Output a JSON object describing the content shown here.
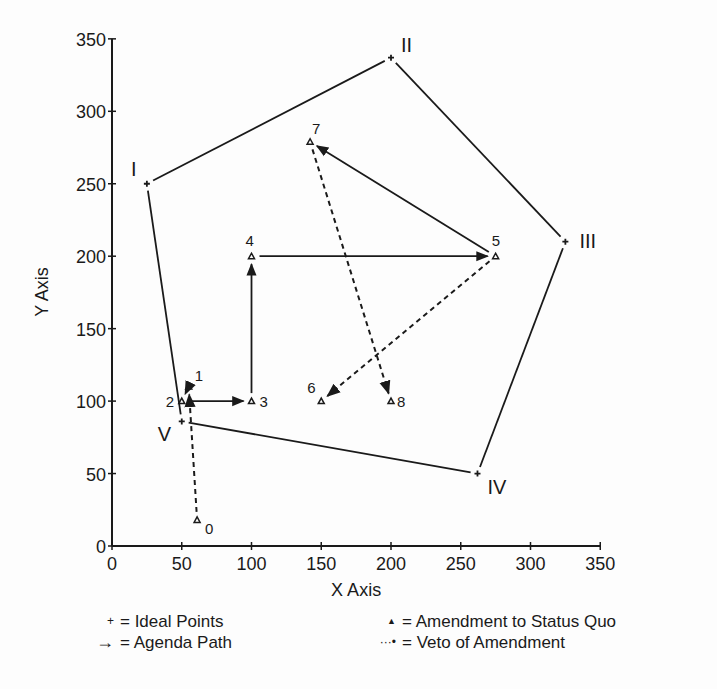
{
  "chart_data": {
    "type": "scatter",
    "title": "",
    "xlabel": "X Axis",
    "ylabel": "Y Axis",
    "xlim": [
      0,
      350
    ],
    "ylim": [
      0,
      350
    ],
    "x_ticks": [
      0,
      50,
      100,
      150,
      200,
      250,
      300,
      350
    ],
    "y_ticks": [
      0,
      50,
      100,
      150,
      200,
      250,
      300,
      350
    ],
    "grid": false,
    "legend_position": "bottom",
    "ideal_points": [
      {
        "label": "I",
        "x": 25,
        "y": 250
      },
      {
        "label": "II",
        "x": 200,
        "y": 337
      },
      {
        "label": "III",
        "x": 325,
        "y": 210
      },
      {
        "label": "IV",
        "x": 262,
        "y": 50
      },
      {
        "label": "V",
        "x": 50,
        "y": 86
      }
    ],
    "ideal_polygon_order": [
      "I",
      "II",
      "III",
      "IV",
      "V"
    ],
    "amendments": [
      {
        "label": "0",
        "x": 61,
        "y": 18
      },
      {
        "label": "1",
        "x": 55,
        "y": 110
      },
      {
        "label": "2",
        "x": 50,
        "y": 100
      },
      {
        "label": "3",
        "x": 100,
        "y": 100
      },
      {
        "label": "4",
        "x": 100,
        "y": 200
      },
      {
        "label": "5",
        "x": 275,
        "y": 200
      },
      {
        "label": "6",
        "x": 150,
        "y": 100
      },
      {
        "label": "7",
        "x": 142,
        "y": 279
      },
      {
        "label": "8",
        "x": 200,
        "y": 100
      }
    ],
    "agenda_path": [
      {
        "from": "2",
        "to": "3"
      },
      {
        "from": "3",
        "to": "4"
      },
      {
        "from": "4",
        "to": "5"
      },
      {
        "from": "5",
        "to": "7"
      }
    ],
    "veto_path": [
      {
        "from": "0",
        "to": "1"
      },
      {
        "from": "1",
        "to": "2"
      },
      {
        "from": "5",
        "to": "6"
      },
      {
        "from": "7",
        "to": "8"
      }
    ]
  },
  "legend": {
    "ideal_points": {
      "symbol": "+",
      "label": "= Ideal Points"
    },
    "agenda_path": {
      "symbol": "→",
      "label": "= Agenda Path"
    },
    "amendment": {
      "symbol": "▲",
      "label": "= Amendment to Status Quo"
    },
    "veto": {
      "symbol": "···•",
      "label": "= Veto of Amendment"
    }
  }
}
